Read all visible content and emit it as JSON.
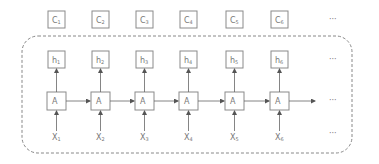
{
  "diagram": {
    "type": "unrolled-rnn",
    "colors": {
      "stroke": "#8a8a8a",
      "text": "#777777",
      "dashed_border": "#888888",
      "background": "#ffffff"
    },
    "columns": [
      {
        "c": "C1",
        "h": "h1",
        "a": "A",
        "x": "X1"
      },
      {
        "c": "C2",
        "h": "h2",
        "a": "A",
        "x": "X2"
      },
      {
        "c": "C3",
        "h": "h3",
        "a": "A",
        "x": "X3"
      },
      {
        "c": "C4",
        "h": "h4",
        "a": "A",
        "x": "X4"
      },
      {
        "c": "C5",
        "h": "h5",
        "a": "A",
        "x": "X5"
      },
      {
        "c": "C6",
        "h": "h6",
        "a": "A",
        "x": "X6"
      }
    ],
    "ellipsis": "···",
    "labels": {
      "c": [
        "C",
        "C",
        "C",
        "C",
        "C",
        "C"
      ],
      "c_sub": [
        "1",
        "2",
        "3",
        "4",
        "5",
        "6"
      ],
      "h": [
        "h",
        "h",
        "h",
        "h",
        "h",
        "h"
      ],
      "h_sub": [
        "1",
        "2",
        "3",
        "4",
        "5",
        "6"
      ],
      "a": [
        "A",
        "A",
        "A",
        "A",
        "A",
        "A"
      ],
      "x": [
        "X",
        "X",
        "X",
        "X",
        "X",
        "X"
      ],
      "x_sub": [
        "1",
        "2",
        "3",
        "4",
        "5",
        "6"
      ]
    }
  }
}
